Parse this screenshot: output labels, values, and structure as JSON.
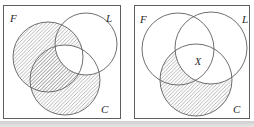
{
  "figure": {
    "type": "venn-diagram-pair",
    "hatch_style": "diagonal-lines",
    "colors": {
      "line": "#5f5f5f",
      "hatch": "#979797",
      "label": "#2a2a2a",
      "background": "#ffffff",
      "page_shadow": "#cfcfcf"
    },
    "panels": [
      {
        "id": "left",
        "set_labels": {
          "f": "F",
          "l": "L",
          "c": "C"
        },
        "region_label": "",
        "shaded_region": "(F union C) minus (C intersect L)"
      },
      {
        "id": "right",
        "set_labels": {
          "f": "F",
          "l": "L",
          "c": "C"
        },
        "region_label": "X",
        "shaded_region": "C minus L"
      }
    ]
  }
}
